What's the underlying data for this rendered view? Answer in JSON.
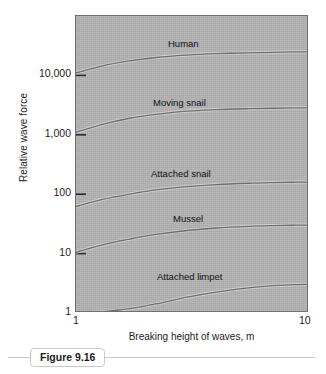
{
  "figure": {
    "caption_label": "Figure 9.16"
  },
  "chart_data": {
    "type": "line",
    "title": "",
    "xlabel": "Breaking height of waves, m",
    "ylabel": "Relative wave force",
    "xscale": "log",
    "yscale": "log",
    "xlim": [
      1,
      10
    ],
    "ylim": [
      1,
      100000
    ],
    "grid": false,
    "legend_position": "inline-curve-labels",
    "xticks": [
      1,
      10
    ],
    "xtick_labels": [
      "1",
      "10"
    ],
    "yticks": [
      1,
      10,
      100,
      1000,
      10000
    ],
    "ytick_labels": [
      "1",
      "10",
      "100",
      "1,000",
      "10,000"
    ],
    "x": [
      1,
      1.3,
      1.7,
      2.2,
      3,
      4,
      5.5,
      7,
      8.5,
      10
    ],
    "series": [
      {
        "name": "Human",
        "label": "Human",
        "values": [
          11000,
          14500,
          17500,
          20000,
          22000,
          23200,
          24000,
          24500,
          24800,
          25000
        ]
      },
      {
        "name": "Moving snail",
        "label": "Moving snail",
        "values": [
          1100,
          1500,
          1900,
          2200,
          2500,
          2650,
          2750,
          2800,
          2830,
          2850
        ]
      },
      {
        "name": "Attached snail",
        "label": "Attached snail",
        "values": [
          62,
          82,
          100,
          118,
          134,
          145,
          153,
          157,
          159,
          160
        ]
      },
      {
        "name": "Mussel",
        "label": "Mussel",
        "values": [
          10.5,
          14,
          17.5,
          21,
          24.5,
          27,
          28.8,
          29.6,
          30,
          30.2
        ]
      },
      {
        "name": "Attached limpet",
        "label": "Attached limpet",
        "values": [
          1.0,
          1.05,
          1.18,
          1.42,
          1.85,
          2.25,
          2.65,
          2.9,
          3.0,
          3.05
        ]
      }
    ],
    "curve_label_positions": [
      {
        "name": "Human",
        "left": 168,
        "top": 38
      },
      {
        "name": "Moving snail",
        "left": 153,
        "top": 97
      },
      {
        "name": "Attached snail",
        "left": 151,
        "top": 168
      },
      {
        "name": "Mussel",
        "left": 173,
        "top": 213
      },
      {
        "name": "Attached limpet",
        "left": 157,
        "top": 271
      }
    ],
    "colors": {
      "plot_background": "#b2b2b2",
      "curve": "#6e6e6e",
      "frame": "#6f6f6f",
      "text": "#1c1c1c"
    }
  }
}
